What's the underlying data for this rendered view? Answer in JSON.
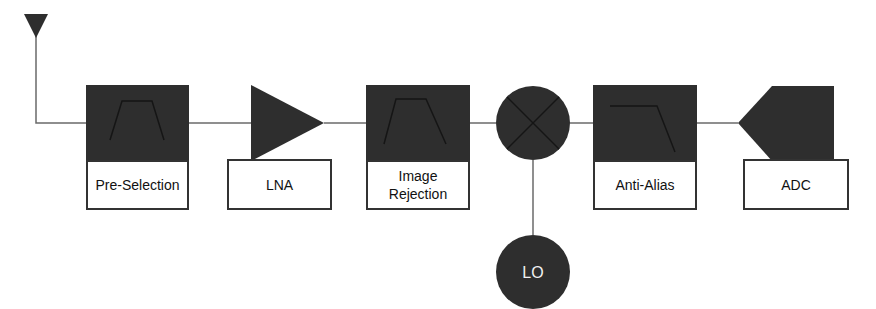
{
  "diagram": {
    "colors": {
      "block_fill": "#2e2e2e",
      "line": "#6a6a6a",
      "label_bg": "#ffffff",
      "label_border": "#333333"
    },
    "nodes": [
      {
        "id": "antenna",
        "type": "antenna",
        "label": ""
      },
      {
        "id": "pre_selection",
        "type": "bandpass-filter",
        "label": "Pre-Selection"
      },
      {
        "id": "lna",
        "type": "amplifier",
        "label": "LNA"
      },
      {
        "id": "image_rejection",
        "type": "bandpass-filter",
        "label_line1": "Image",
        "label_line2": "Rejection"
      },
      {
        "id": "mixer",
        "type": "mixer",
        "label": ""
      },
      {
        "id": "lo",
        "type": "oscillator",
        "label": "LO"
      },
      {
        "id": "anti_alias",
        "type": "lowpass-filter",
        "label": "Anti-Alias"
      },
      {
        "id": "adc",
        "type": "adc",
        "label": "ADC"
      }
    ],
    "edges": [
      {
        "from": "antenna",
        "to": "pre_selection"
      },
      {
        "from": "pre_selection",
        "to": "lna"
      },
      {
        "from": "lna",
        "to": "image_rejection"
      },
      {
        "from": "image_rejection",
        "to": "mixer"
      },
      {
        "from": "lo",
        "to": "mixer"
      },
      {
        "from": "mixer",
        "to": "anti_alias"
      },
      {
        "from": "anti_alias",
        "to": "adc"
      }
    ]
  }
}
